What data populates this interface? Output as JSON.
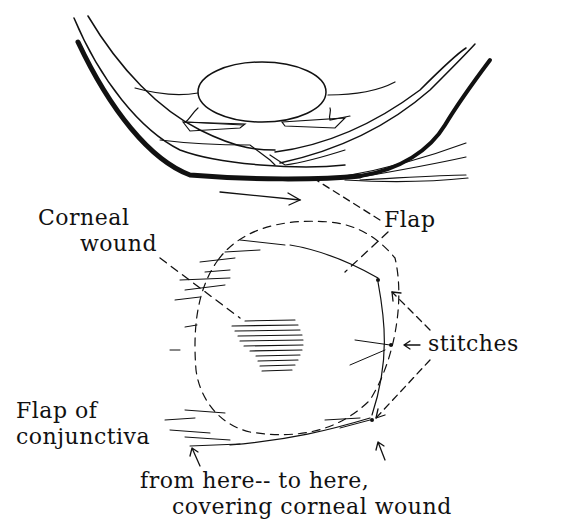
{
  "diagram": {
    "labels": {
      "corneal_wound_line1": "Corneal",
      "corneal_wound_line2": "wound",
      "flap": "Flap",
      "stitches": "stitches",
      "flap_of_conjunctiva_line1": "Flap of",
      "flap_of_conjunctiva_line2": "conjunctiva",
      "from_here": "from here-- to here,",
      "covering": "covering corneal wound"
    },
    "colors": {
      "ink": "#111111",
      "background": "#ffffff"
    }
  }
}
